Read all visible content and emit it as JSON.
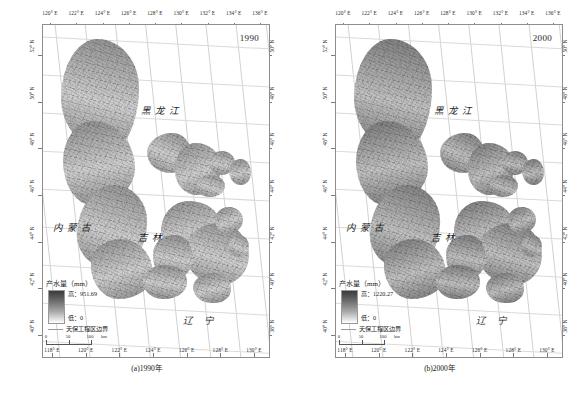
{
  "figure": {
    "panels": [
      {
        "id": "panel-a",
        "year_label": "1990",
        "caption": "(a)1990年",
        "legend": {
          "title": "产水量（mm）",
          "high_label": "高：951.69",
          "low_label": "低：0",
          "high_value": 951.69,
          "low_value": 0,
          "boundary_label": "天保工程区边界"
        },
        "scalebar": {
          "ticks": [
            "0",
            "50",
            "100"
          ],
          "unit": "km"
        },
        "place_names": [
          "黑龙江",
          "内蒙古",
          "吉林",
          "辽 宁"
        ],
        "axes": {
          "top_labels": [
            "120° E",
            "122° E",
            "124° E",
            "126° E",
            "128° E",
            "130° E",
            "132° E",
            "134° E",
            "136° E"
          ],
          "bottom_labels": [
            "118° E",
            "120° E",
            "122° E",
            "124° E",
            "126° E",
            "128° E",
            "130° E"
          ],
          "left_labels": [
            "52° N",
            "50° N",
            "48° N",
            "46° N",
            "44° N",
            "42° N",
            "40° N"
          ],
          "right_labels": [
            "50° N",
            "48° N",
            "46° N",
            "44° N",
            "42° N",
            "40° N",
            "38° N"
          ]
        }
      },
      {
        "id": "panel-b",
        "year_label": "2000",
        "caption": "(b)2000年",
        "legend": {
          "title": "产水量（mm）",
          "high_label": "高：1220.27",
          "low_label": "低：0",
          "high_value": 1220.27,
          "low_value": 0,
          "boundary_label": "天保工程区边界"
        },
        "scalebar": {
          "ticks": [
            "0",
            "50",
            "100"
          ],
          "unit": "km"
        },
        "place_names": [
          "黑龙江",
          "内蒙古",
          "吉林",
          "辽 宁"
        ],
        "axes": {
          "top_labels": [
            "120° E",
            "122° E",
            "124° E",
            "126° E",
            "128° E",
            "130° E",
            "132° E",
            "134° E",
            "136° E"
          ],
          "bottom_labels": [
            "118° E",
            "120° E",
            "122° E",
            "124° E",
            "126° E",
            "128° E",
            "130° E"
          ],
          "left_labels": [
            "52° N",
            "50° N",
            "48° N",
            "46° N",
            "44° N",
            "42° N",
            "40° N"
          ],
          "right_labels": [
            "50° N",
            "48° N",
            "46° N",
            "44° N",
            "42° N",
            "40° N",
            "38° N"
          ]
        }
      }
    ]
  },
  "chart_data": {
    "type": "heatmap",
    "variable": "产水量",
    "unit": "mm",
    "colormap": "grayscale (dark = high, white = low)",
    "panels": [
      {
        "name": "(a)1990年",
        "year": 1990,
        "vmin": 0,
        "vmax": 951.69
      },
      {
        "name": "(b)2000年",
        "year": 2000,
        "vmin": 0,
        "vmax": 1220.27
      }
    ],
    "xlabel": "经度",
    "ylabel": "纬度",
    "xlim": [
      118,
      136
    ],
    "ylim": [
      38,
      53
    ],
    "xticks": [
      118,
      120,
      122,
      124,
      126,
      128,
      130,
      132,
      134,
      136
    ],
    "yticks": [
      38,
      40,
      42,
      44,
      46,
      48,
      50,
      52
    ],
    "grid": true,
    "legend_position": "lower-left",
    "annotations": [
      "黑龙江",
      "内蒙古",
      "吉林",
      "辽 宁",
      "1990",
      "2000"
    ]
  }
}
